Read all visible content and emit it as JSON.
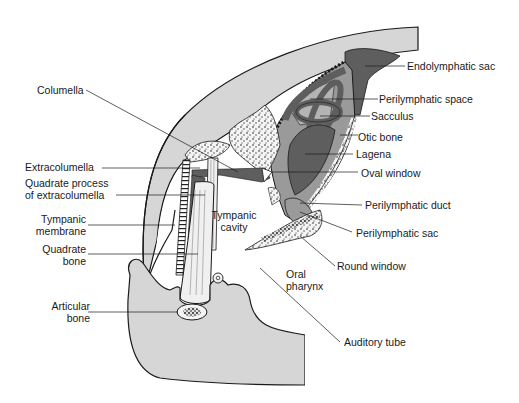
{
  "figure": {
    "colors": {
      "tissue_gray": "#d6d6d6",
      "membranous_dark": "#5e5e5e",
      "perilymph_mid": "#9a9a9a",
      "bone_white": "#f4f4f4",
      "outline": "#1a1a1a",
      "background": "#ffffff"
    }
  },
  "labels": {
    "left": {
      "columella": "Columella",
      "extracolumella": "Extracolumella",
      "quadrate_process_1": "Quadrate process",
      "quadrate_process_2": "of extracolumella",
      "tympanic_membrane_1": "Tympanic",
      "tympanic_membrane_2": "membrane",
      "quadrate_bone_1": "Quadrate",
      "quadrate_bone_2": "bone",
      "articular_bone_1": "Articular",
      "articular_bone_2": "bone"
    },
    "right": {
      "endolymphatic_sac": "Endolymphatic sac",
      "perilymphatic_space": "Perilymphatic space",
      "sacculus": "Sacculus",
      "otic_bone": "Otic bone",
      "lagena": "Lagena",
      "oval_window": "Oval window",
      "perilymphatic_duct": "Perilymphatic duct",
      "perilymphatic_sac": "Perilymphatic sac",
      "round_window": "Round window",
      "auditory_tube": "Auditory tube"
    },
    "inline": {
      "tympanic_cavity_1": "Tympanic",
      "tympanic_cavity_2": "cavity",
      "oral_pharynx_1": "Oral",
      "oral_pharynx_2": "pharynx"
    }
  }
}
